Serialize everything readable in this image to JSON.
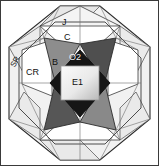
{
  "figure": {
    "name": "octagonal-star-polyhedron-diagram",
    "width": 159,
    "height": 166,
    "background": "#ffffff",
    "border_color": "#3a3a3a"
  },
  "labels": [
    {
      "id": "J",
      "text": "J",
      "x": 62,
      "y": 18,
      "color": "#111111",
      "rotation": 0,
      "size": 9
    },
    {
      "id": "C",
      "text": "C",
      "x": 64,
      "y": 33,
      "color": "#111111",
      "rotation": 0,
      "size": 9
    },
    {
      "id": "SR",
      "text": "SR",
      "x": 10,
      "y": 58,
      "color": "#111111",
      "rotation": -62,
      "size": 8
    },
    {
      "id": "CR",
      "text": "CR",
      "x": 26,
      "y": 68,
      "color": "#111111",
      "rotation": 0,
      "size": 9
    },
    {
      "id": "B",
      "text": "B",
      "x": 52,
      "y": 58,
      "color": "#111111",
      "rotation": 0,
      "size": 9
    },
    {
      "id": "O2",
      "text": "O2",
      "x": 73,
      "y": 60,
      "color": "#f2f2f2",
      "rotation": 0,
      "size": 9
    },
    {
      "id": "E1",
      "text": "E1",
      "x": 74,
      "y": 84,
      "color": "#222222",
      "rotation": 0,
      "size": 9
    }
  ],
  "palette": {
    "white_face": "#ffffff",
    "pale_face": "#eeeeee",
    "light_gray_face": "#dcdcdc",
    "mid_gray_face": "#8a8a8a",
    "dark_gray_face": "#5a5a5a",
    "near_black_face": "#1c1c1c",
    "edge_line": "#2b2b2b",
    "thin_line": "#6d6d6d",
    "inner_square_light": "#f7f7f7",
    "inner_square_dark": "#b4b4b4"
  },
  "geometry": {
    "description": "Regular octagon outline with inscribed six-pointed star arrangement of shaded triangles around a central dark rhombus containing a light gradient square.",
    "octagon_vertices": [
      [
        60,
        6
      ],
      [
        100,
        6
      ],
      [
        150,
        47
      ],
      [
        150,
        119
      ],
      [
        100,
        160
      ],
      [
        60,
        160
      ],
      [
        9,
        119
      ],
      [
        9,
        47
      ]
    ],
    "center": [
      80,
      83
    ]
  }
}
